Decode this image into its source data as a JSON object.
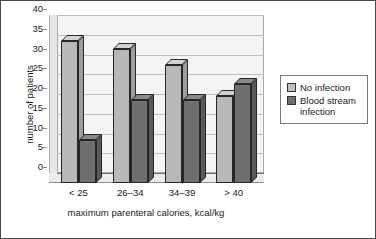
{
  "chart_data": {
    "type": "bar",
    "title": "",
    "xlabel": "maximum parenteral calories, kcal/kg",
    "ylabel": "number of patients",
    "categories": [
      "< 25",
      "26–34",
      "34–39",
      "> 40"
    ],
    "series": [
      {
        "name": "No infection",
        "color": "#b8b8b8",
        "values": [
          36,
          34,
          30,
          22
        ]
      },
      {
        "name": "Blood stream infection",
        "color": "#6f6f6f",
        "values": [
          11,
          21,
          21,
          25
        ]
      }
    ],
    "ylim": [
      0,
      40
    ],
    "ytick_labels": [
      "40",
      "35",
      "30",
      "25",
      "20",
      "15",
      "10",
      "5",
      "0"
    ],
    "ytick_values": [
      40,
      35,
      30,
      25,
      20,
      15,
      10,
      5,
      0
    ],
    "grid": true,
    "legend_position": "right",
    "style": "3d-column",
    "plot_background": "#f4f4f4",
    "gridline_color": "#bfbfbf",
    "frame_color": "#4a4a4a"
  },
  "legend": {
    "entries": [
      {
        "label": "No infection",
        "swatch": "light"
      },
      {
        "label": "Blood stream infection",
        "swatch": "dark"
      }
    ]
  }
}
